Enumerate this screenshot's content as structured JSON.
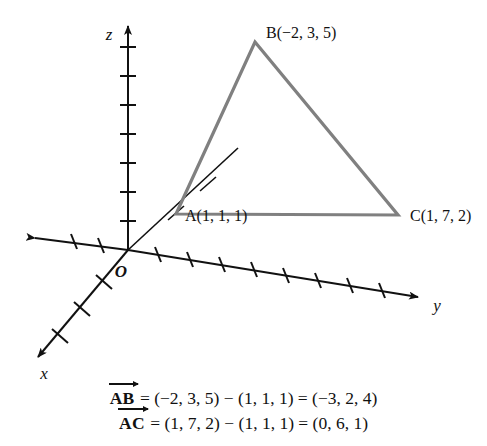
{
  "figure": {
    "type": "3d-coordinate-diagram",
    "background_color": "#ffffff",
    "axis_color": "#111111",
    "triangle_color": "#808080",
    "axes": [
      {
        "name": "x",
        "label": "x",
        "direction": "down-left",
        "tick_count": 6
      },
      {
        "name": "y",
        "label": "y",
        "direction": "right",
        "tick_count": 9,
        "negative_tick_count": 2
      },
      {
        "name": "z",
        "label": "z",
        "direction": "up",
        "tick_count": 7
      }
    ],
    "origin": {
      "label": "O"
    },
    "points": [
      {
        "name": "A",
        "label": "A(1, 1, 1)",
        "coords": [
          1,
          1,
          1
        ]
      },
      {
        "name": "B",
        "label": "B(−2, 3, 5)",
        "coords": [
          -2,
          3,
          5
        ]
      },
      {
        "name": "C",
        "label": "C(1, 7, 2)",
        "coords": [
          1,
          7,
          2
        ]
      }
    ],
    "triangle": {
      "vertices": [
        "A",
        "B",
        "C"
      ]
    }
  },
  "equations": [
    {
      "vector": "AB",
      "text": "= (−2, 3, 5) − (1, 1, 1) = (−3, 2, 4)"
    },
    {
      "vector": "AC",
      "text": "= (1, 7, 2) − (1, 1, 1) = (0, 6, 1)"
    }
  ]
}
